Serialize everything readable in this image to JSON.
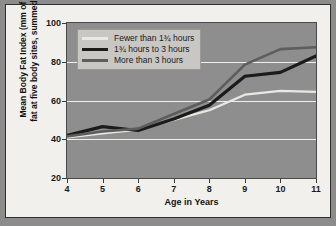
{
  "chart_data": {
    "type": "line",
    "title": "",
    "xlabel": "Age in Years",
    "ylabel": "Mean Body Fat Index (mm of fat at five body sites, summed)",
    "ylabel_line1": "Mean Body Fat Index (mm of",
    "ylabel_line2": "fat at five body sites, summed)",
    "x": [
      4,
      5,
      6,
      7,
      8,
      9,
      10,
      11
    ],
    "xlim": [
      4,
      11
    ],
    "ylim": [
      20,
      100
    ],
    "xticks": [
      "4",
      "5",
      "6",
      "7",
      "8",
      "9",
      "10",
      "11"
    ],
    "yticks": [
      "20",
      "40",
      "60",
      "80",
      "100"
    ],
    "ytick_values": [
      20,
      40,
      60,
      80,
      100
    ],
    "gridlines": [
      40,
      60,
      80
    ],
    "grid": true,
    "legend_position": "upper left",
    "series": [
      {
        "name": "Fewer than 1¾ hours",
        "color": "#e8e8e4",
        "width": 2.2,
        "values": [
          41,
          43,
          45,
          50,
          55,
          63,
          65,
          64.5
        ]
      },
      {
        "name": "1¾ hours to 3 hours",
        "color": "#1b1b1b",
        "width": 3.2,
        "values": [
          42,
          46.5,
          44.5,
          50.5,
          57.5,
          72.5,
          74.5,
          83
        ]
      },
      {
        "name": "More than 3 hours",
        "color": "#5d5d5d",
        "width": 2.6,
        "values": [
          41.5,
          44,
          45.5,
          53,
          60.5,
          78.5,
          86.5,
          87.5
        ]
      }
    ]
  },
  "legend": {
    "items": [
      {
        "label": "Fewer than 1¾ hours",
        "color": "#e8e8e4"
      },
      {
        "label": "1¾ hours to 3 hours",
        "color": "#1b1b1b"
      },
      {
        "label": "More than 3 hours",
        "color": "#5d5d5d"
      }
    ]
  },
  "colors": {
    "plot_background": "#8e8e8e",
    "card_background": "#f2f0ec",
    "gridline": "#efefef",
    "page_background": "#8c8c8c",
    "axis_text": "#1a1a1a"
  }
}
